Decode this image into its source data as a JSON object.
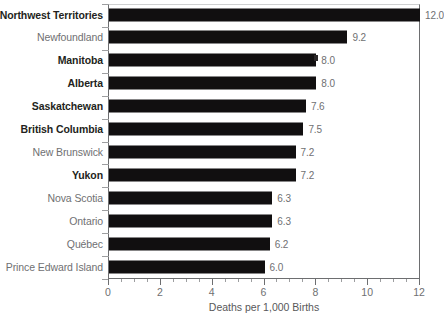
{
  "chart_data": {
    "type": "bar",
    "orientation": "horizontal",
    "title": "",
    "xlabel": "Deaths per 1,000 Births",
    "ylabel": "",
    "xlim": [
      0,
      12
    ],
    "xticks": [
      0,
      2,
      4,
      6,
      8,
      10,
      12
    ],
    "xtick_labels": [
      "0",
      "2",
      "4",
      "6",
      "8",
      "10",
      "12"
    ],
    "minor_tick_interval": 0.5,
    "grid": false,
    "legend": null,
    "categories": [
      "Northwest Territories",
      "Newfoundland",
      "Manitoba",
      "Alberta",
      "Saskatchewan",
      "British Columbia",
      "New Brunswick",
      "Yukon",
      "Nova Scotia",
      "Ontario",
      "Québec",
      "Prince Edward Island"
    ],
    "values": [
      12.0,
      9.2,
      8.0,
      8.0,
      7.6,
      7.5,
      7.2,
      7.2,
      6.3,
      6.3,
      6.2,
      6.0
    ],
    "value_labels": [
      "12.0",
      "9.2",
      "8.0",
      "8.0",
      "7.6",
      "7.5",
      "7.2",
      "7.2",
      "6.3",
      "6.3",
      "6.2",
      "6.0"
    ],
    "emphasis": [
      true,
      false,
      true,
      true,
      true,
      true,
      false,
      true,
      false,
      false,
      false,
      false
    ],
    "bar_color": "#110f10",
    "label_color": "#6f7072",
    "emphasis_label_color": "#231f20",
    "axis_color": "#6d6e70",
    "background_color": "#ffffff"
  }
}
